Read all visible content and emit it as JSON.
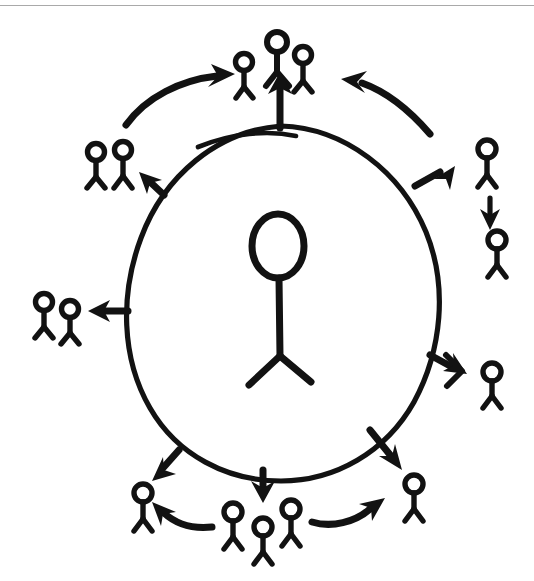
{
  "page": {
    "background_color": "#ffffff",
    "ink_color": "#121212",
    "scan_rule_color": "#9a9a9a",
    "width": 534,
    "height": 581
  },
  "diagram": {
    "type": "hand-drawn radial diffusion / spread diagram",
    "medium": "black marker on white paper, scanned",
    "center_shape": {
      "name": "large egg-shaped oval enclosure",
      "description": "Tall egg/ovoid outline, narrower at the top and wider at the bottom, drawn with a single continuous marker stroke",
      "bounds": {
        "x": 125,
        "y": 125,
        "width": 315,
        "height": 358
      },
      "stroke_width": 5,
      "accent_stroke": "short separate arc overlapping the top of the oval"
    },
    "center_figure": {
      "name": "large central stick figure",
      "description": "Single large stick person inside the oval: tall oval head, straight vertical torso, two splayed legs, no arms",
      "head": {
        "cx": 278,
        "cy": 245,
        "rx": 27,
        "ry": 33
      },
      "torso": {
        "x": 279,
        "y1": 278,
        "y2": 355
      },
      "legs": [
        {
          "x2": 248,
          "y2": 385
        },
        {
          "x2": 310,
          "y2": 382
        }
      ],
      "stroke_width": 7
    },
    "outer_groups": [
      {
        "id": "top",
        "label": "top cluster",
        "position": "above the oval",
        "figure_count": 3,
        "anchor": {
          "x": 278,
          "y": 60
        },
        "receives_from": [
          "center-oval (straight up arrow)",
          "top-left cluster (curved arrow)",
          "right-upper figure (curved arrow)"
        ]
      },
      {
        "id": "top-left",
        "label": "upper-left pair",
        "position": "upper left of the oval",
        "figure_count": 2,
        "anchor": {
          "x": 110,
          "y": 160
        },
        "receives_from": [
          "oval edge (short straight arrow)"
        ]
      },
      {
        "id": "left",
        "label": "left pair",
        "position": "left of the oval",
        "figure_count": 2,
        "anchor": {
          "x": 55,
          "y": 310
        },
        "receives_from": [
          "center-oval (straight left arrow)"
        ]
      },
      {
        "id": "right-upper",
        "label": "upper-right figure",
        "position": "upper right of the oval",
        "figure_count": 1,
        "anchor": {
          "x": 490,
          "y": 160
        },
        "receives_from": [
          "oval edge (short up-right arrow)"
        ]
      },
      {
        "id": "right-upper-second",
        "label": "second upper-right figure",
        "position": "below the upper-right figure",
        "figure_count": 1,
        "anchor": {
          "x": 499,
          "y": 245
        },
        "receives_from": [
          "upper-right figure (short down arrow)"
        ]
      },
      {
        "id": "right",
        "label": "right figure",
        "position": "right of the oval",
        "figure_count": 1,
        "anchor": {
          "x": 495,
          "y": 375
        },
        "receives_from": [
          "oval edge (short right arrow)"
        ]
      },
      {
        "id": "bottom-right",
        "label": "lower-right figure",
        "position": "lower right of the oval",
        "figure_count": 1,
        "anchor": {
          "x": 415,
          "y": 490
        },
        "receives_from": [
          "oval edge (down-right arrow)",
          "bottom cluster (curved arrow)"
        ]
      },
      {
        "id": "bottom-center",
        "label": "bottom cluster",
        "position": "below the oval",
        "figure_count": 3,
        "anchor": {
          "x": 262,
          "y": 515
        },
        "receives_from": [
          "center-oval (straight down arrow)"
        ]
      },
      {
        "id": "bottom-left",
        "label": "lower-left figure",
        "position": "lower left of the oval",
        "figure_count": 1,
        "anchor": {
          "x": 145,
          "y": 500
        },
        "receives_from": [
          "oval edge (down-left arrow)",
          "bottom cluster (curved arrow)"
        ]
      }
    ],
    "arrows": {
      "straight_radial": [
        {
          "id": "arrow-up",
          "from": "oval top",
          "to": "top cluster",
          "direction": "up"
        },
        {
          "id": "arrow-upper-left",
          "from": "oval upper-left edge",
          "to": "upper-left pair",
          "direction": "up-left"
        },
        {
          "id": "arrow-left",
          "from": "oval left edge",
          "to": "left pair",
          "direction": "left"
        },
        {
          "id": "arrow-upper-right",
          "from": "oval upper-right edge",
          "to": "upper-right figure",
          "direction": "up-right"
        },
        {
          "id": "arrow-right",
          "from": "oval right edge",
          "to": "right figure",
          "direction": "right"
        },
        {
          "id": "arrow-down-right",
          "from": "oval lower-right edge",
          "to": "lower-right figure",
          "direction": "down-right"
        },
        {
          "id": "arrow-down",
          "from": "oval bottom",
          "to": "bottom cluster",
          "direction": "down"
        },
        {
          "id": "arrow-down-left",
          "from": "oval lower-left edge",
          "to": "lower-left figure",
          "direction": "down-left"
        },
        {
          "id": "arrow-right-chain",
          "from": "upper-right figure",
          "to": "second upper-right figure",
          "direction": "down"
        }
      ],
      "curved_peripheral": [
        {
          "id": "curve-topleft-to-top",
          "from": "upper-left pair",
          "to": "top cluster",
          "sweep": "clockwise, arcing over the top-left"
        },
        {
          "id": "curve-right-to-top",
          "from": "upper-right region",
          "to": "top cluster",
          "sweep": "counter-clockwise, arcing over the top-right"
        },
        {
          "id": "curve-bottom-to-bottomleft",
          "from": "bottom cluster",
          "to": "lower-left figure",
          "sweep": "arcing left along the bottom"
        },
        {
          "id": "curve-bottom-to-bottomright",
          "from": "bottom cluster",
          "to": "lower-right figure",
          "sweep": "arcing right along the bottom"
        }
      ]
    },
    "totals": {
      "central_figures": 1,
      "peripheral_figures": 14,
      "straight_arrows": 9,
      "curved_arrows": 4
    }
  }
}
